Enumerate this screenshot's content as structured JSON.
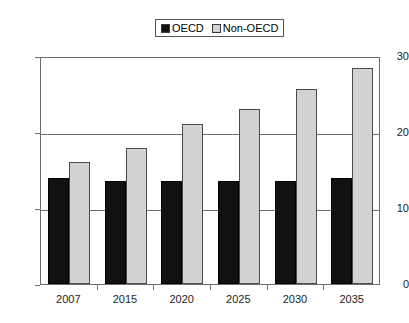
{
  "chart_data": {
    "type": "bar",
    "title": "",
    "xlabel": "",
    "ylabel": "",
    "categories": [
      "2007",
      "2015",
      "2020",
      "2025",
      "2030",
      "2035"
    ],
    "series": [
      {
        "name": "OECD",
        "color": "#111111",
        "values": [
          14.0,
          13.5,
          13.5,
          13.5,
          13.6,
          13.9
        ]
      },
      {
        "name": "Non-OECD",
        "color": "#d2d2d2",
        "values": [
          16.0,
          17.9,
          21.0,
          23.0,
          25.7,
          28.4
        ]
      }
    ],
    "ylim": [
      0,
      30
    ],
    "yticks": [
      "0",
      "10",
      "20",
      "30"
    ],
    "ytick_values": [
      0,
      10,
      20,
      30
    ],
    "grid": true,
    "gridlines_at": [
      10,
      20,
      30
    ],
    "legend_position": "top-center",
    "legend": [
      {
        "label": "OECD",
        "color": "#111111"
      },
      {
        "label": "Non-OECD",
        "color": "#d2d2d2"
      }
    ]
  }
}
